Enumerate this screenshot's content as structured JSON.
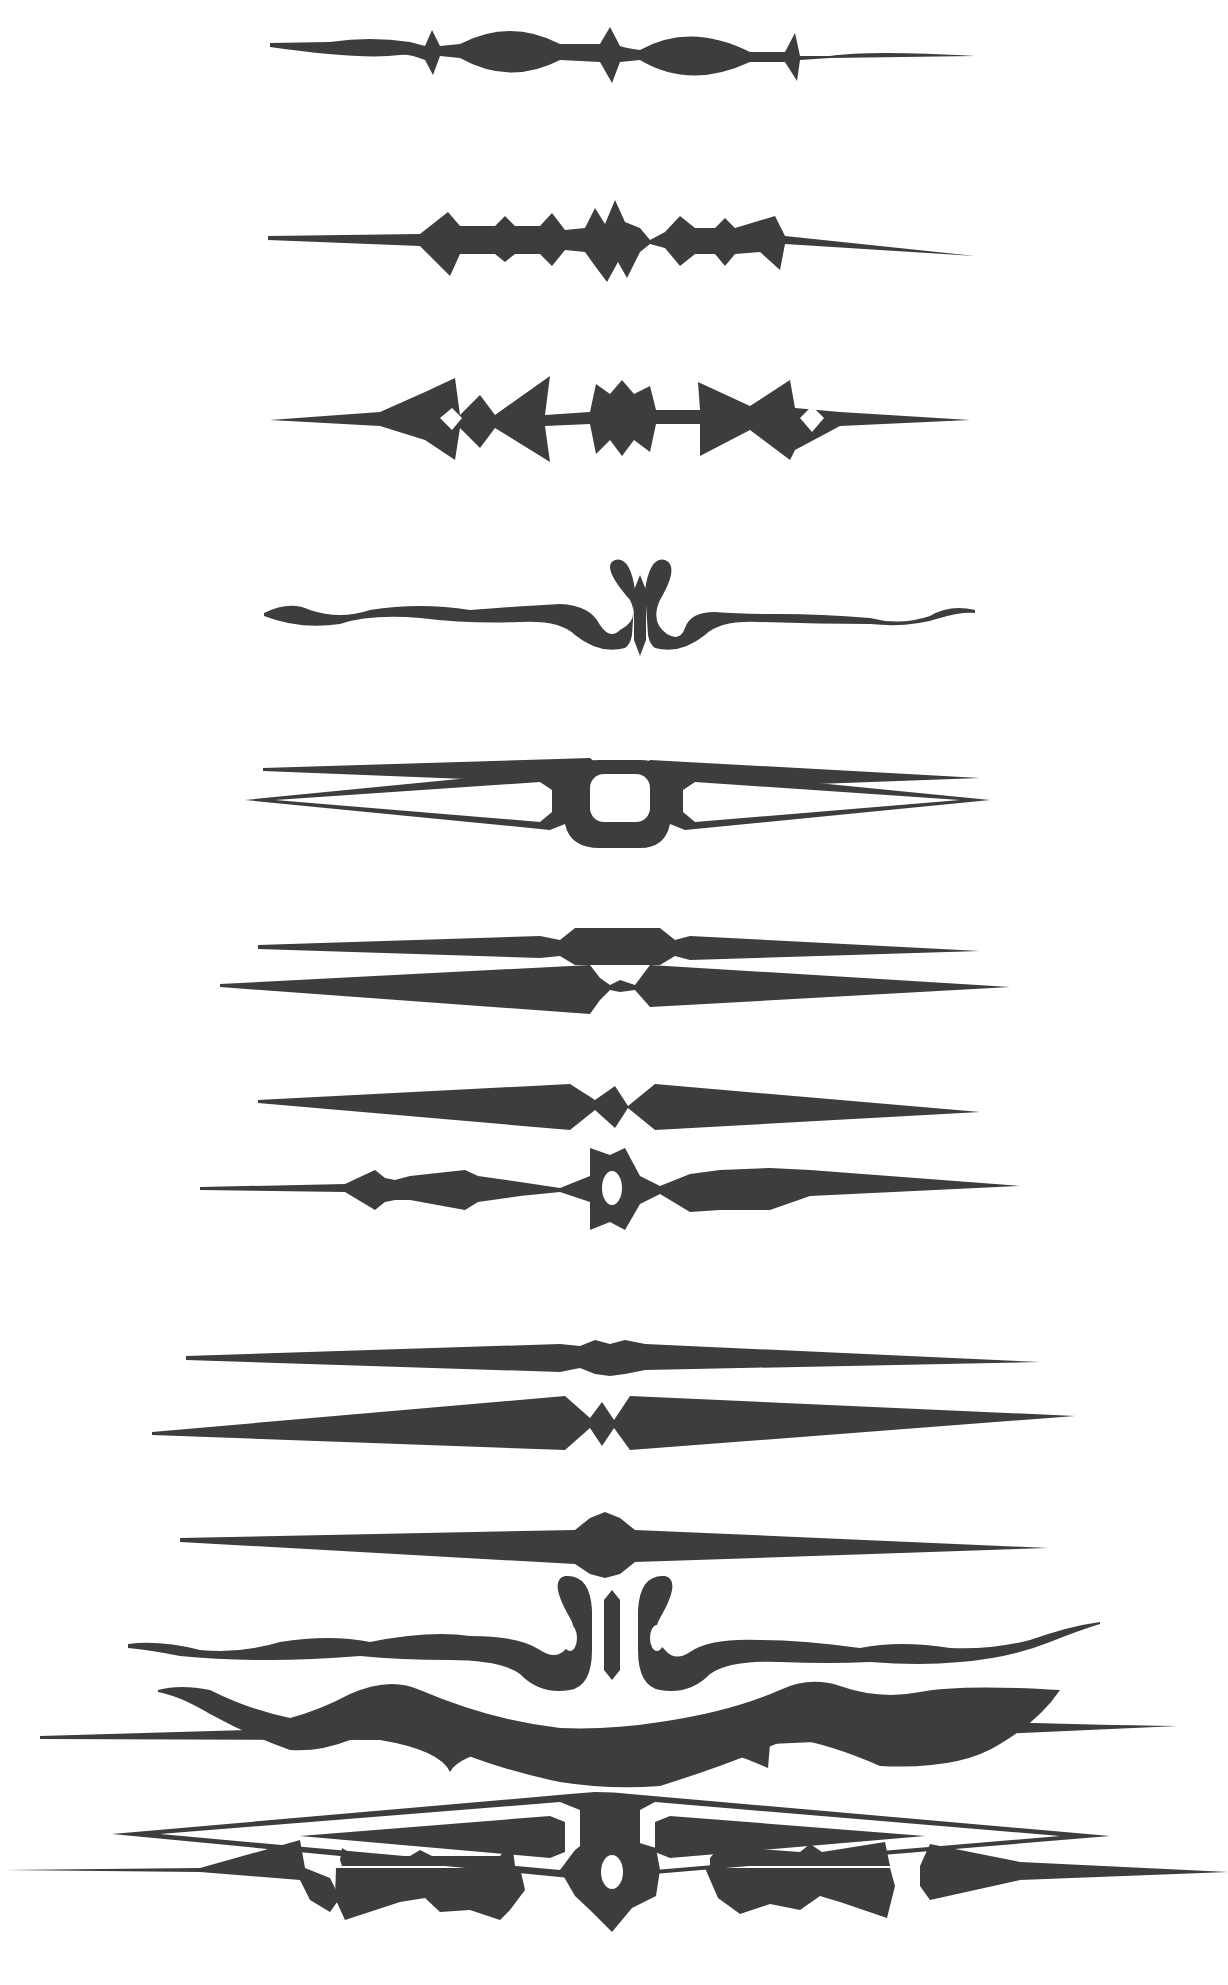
{
  "page": {
    "background": "#ffffff",
    "ink_color": "#3d3d3d"
  },
  "ornaments": [
    {
      "index": 1,
      "name": "beaded-lozenge-rule",
      "y": 78
    },
    {
      "index": 2,
      "name": "spiked-star-rule",
      "y": 240
    },
    {
      "index": 3,
      "name": "arrowhead-diamond-rule",
      "y": 418
    },
    {
      "index": 4,
      "name": "scroll-wave-rule",
      "y": 612
    },
    {
      "index": 5,
      "name": "small-diamond-rule",
      "y": 772
    },
    {
      "index": 6,
      "name": "oblong-center-rule",
      "y": 950
    },
    {
      "index": 7,
      "name": "diamond-taper-rule",
      "y": 1115
    },
    {
      "index": 8,
      "name": "open-loop-rule",
      "y": 818
    },
    {
      "index": 9,
      "name": "pinched-taper-rule",
      "y": 988
    },
    {
      "index": 10,
      "name": "ring-star-rule",
      "y": 1184
    },
    {
      "index": 11,
      "name": "bead-taper-rule",
      "y": 1358
    },
    {
      "index": 12,
      "name": "oval-bead-rule",
      "y": 1544
    },
    {
      "index": 13,
      "name": "wave-swell-rule",
      "y": 1750
    },
    {
      "index": 14,
      "name": "diamond-gap-rule",
      "y": 1413
    },
    {
      "index": 15,
      "name": "double-scroll-wave-rule",
      "y": 1610
    },
    {
      "index": 16,
      "name": "interlaced-loop-rule",
      "y": 1838
    },
    {
      "index": 17,
      "name": "spiked-swell-rule",
      "y": 1866
    },
    {
      "index": 18,
      "name": "bat-wing-star-rule",
      "y": 1870
    }
  ]
}
